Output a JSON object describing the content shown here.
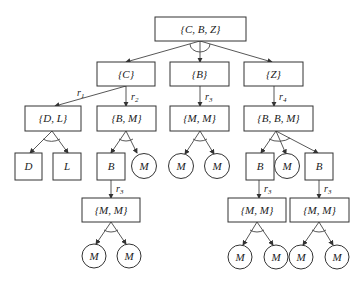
{
  "diagram": {
    "type": "and-or tree",
    "nodes": {
      "root": "{C, B, Z}",
      "c": "{C}",
      "b": "{B}",
      "z": "{Z}",
      "dl": "{D, L}",
      "bm": "{B, M}",
      "mm1": "{M, M}",
      "bbm": "{B, B, M}",
      "d": "D",
      "l": "L",
      "b1": "B",
      "m1": "M",
      "m2": "M",
      "m3": "M",
      "b2": "B",
      "m4": "M",
      "b3": "B",
      "mm2": "{M, M}",
      "mm3": "{M, M}",
      "mm4": "{M, M}",
      "m5": "M",
      "m6": "M",
      "m7": "M",
      "m8": "M",
      "m9": "M",
      "m10": "M"
    },
    "rules": {
      "r1": "r",
      "r1_sub": "1",
      "r2": "r",
      "r2_sub": "2",
      "r3a": "r",
      "r3a_sub": "3",
      "r4": "r",
      "r4_sub": "4",
      "r3b": "r",
      "r3b_sub": "3",
      "r3c": "r",
      "r3c_sub": "3",
      "r3d": "r",
      "r3d_sub": "3"
    }
  }
}
